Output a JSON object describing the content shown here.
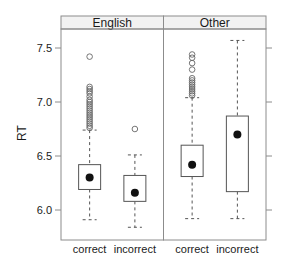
{
  "chart_data": {
    "type": "boxplot",
    "title": "",
    "xlabel": "",
    "ylabel": "RT",
    "ylim": [
      5.78,
      7.77
    ],
    "yticks": [
      6.0,
      6.5,
      7.0,
      7.5
    ],
    "ytick_labels": [
      "6.0",
      "6.5",
      "7.0",
      "7.5"
    ],
    "grid": false,
    "legend": null,
    "panels": [
      {
        "strip": "English",
        "categories": [
          "correct",
          "incorrect"
        ],
        "boxes": [
          {
            "category": "correct",
            "whisker_low": 5.91,
            "q1": 6.19,
            "median": 6.3,
            "q3": 6.42,
            "whisker_high": 6.74,
            "outliers": [
              7.42,
              7.14,
              7.12,
              7.1,
              7.08,
              7.05,
              7.02,
              7.0,
              6.98,
              6.96,
              6.94,
              6.92,
              6.9,
              6.88,
              6.86,
              6.84,
              6.82,
              6.8,
              6.78,
              6.76
            ]
          },
          {
            "category": "incorrect",
            "whisker_low": 5.84,
            "q1": 6.08,
            "median": 6.16,
            "q3": 6.32,
            "whisker_high": 6.51,
            "outliers": [
              6.75
            ]
          }
        ]
      },
      {
        "strip": "Other",
        "categories": [
          "correct",
          "incorrect"
        ],
        "boxes": [
          {
            "category": "correct",
            "whisker_low": 5.92,
            "q1": 6.31,
            "median": 6.42,
            "q3": 6.6,
            "whisker_high": 7.04,
            "outliers": [
              7.44,
              7.41,
              7.36,
              7.3,
              7.22,
              7.2,
              7.18,
              7.16,
              7.14,
              7.12,
              7.1,
              7.08,
              7.06
            ]
          },
          {
            "category": "incorrect",
            "whisker_low": 5.92,
            "q1": 6.17,
            "median": 6.7,
            "q3": 6.87,
            "whisker_high": 7.57,
            "outliers": []
          }
        ]
      }
    ]
  },
  "colors": {
    "frame": "#8c8c8c",
    "strip_bg": "#f2f2f2",
    "box": "#555555",
    "whisker": "#555555",
    "median_dot": "#111111",
    "outlier": "#666666",
    "text": "#1a1a1a"
  }
}
